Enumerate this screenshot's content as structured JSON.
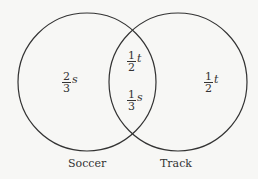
{
  "circles": [
    {
      "name": "Soccer",
      "cx": 87,
      "cy": 82,
      "r": 69
    },
    {
      "name": "Track",
      "cx": 178,
      "cy": 82,
      "r": 69
    }
  ],
  "regions": {
    "soccer_only": {
      "num": "2",
      "den": "3",
      "var": "s"
    },
    "both_top": {
      "num": "1",
      "den": "2",
      "var": "t"
    },
    "both_bottom": {
      "num": "1",
      "den": "3",
      "var": "s"
    },
    "track_only": {
      "num": "1",
      "den": "2",
      "var": "t"
    }
  },
  "labels": {
    "soccer": "Soccer",
    "track": "Track"
  },
  "colors": {
    "stroke": "#333333",
    "background": "#f7f7f5"
  }
}
